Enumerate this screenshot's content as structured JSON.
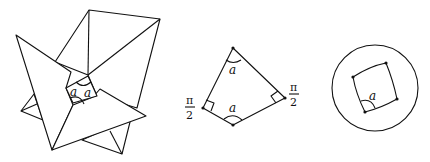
{
  "figures": {
    "left": {
      "description": "Hyperbolic polyhedron folding (pinwheel of flaps around a central quadrilateral)",
      "angle_labels": [
        "a",
        "a"
      ]
    },
    "middle": {
      "description": "Quadrilateral with two right angles and two angles a",
      "angle_labels": {
        "top": "a",
        "bottom": "a"
      },
      "right_angle_labels": {
        "left_num": "π",
        "left_den": "2",
        "right_num": "π",
        "right_den": "2"
      }
    },
    "right": {
      "description": "Hyperbolic quadrilateral inside a disk model",
      "angle_label": "a"
    }
  },
  "colors": {
    "stroke": "#111111",
    "background": "#ffffff"
  }
}
